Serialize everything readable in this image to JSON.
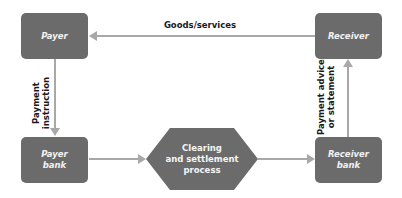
{
  "diagram": {
    "colors": {
      "node_fill": "#6b6b6b",
      "node_text": "#f2f2f2",
      "arrow": "#a8a8a8",
      "edge_text": "#1a1a1a",
      "background": "#ffffff"
    },
    "nodes": {
      "payer": {
        "label": "Payer",
        "shape": "rounded-rect"
      },
      "receiver": {
        "label": "Receiver",
        "shape": "rounded-rect"
      },
      "payer_bank": {
        "label": "Payer\nbank",
        "shape": "rounded-rect"
      },
      "receiver_bank": {
        "label": "Receiver\nbank",
        "shape": "rounded-rect"
      },
      "clearing": {
        "label": "Clearing\nand settlement\nprocess",
        "shape": "hexagon"
      }
    },
    "edges": {
      "goods": {
        "from": "receiver",
        "to": "payer",
        "label": "Goods/services"
      },
      "instruction": {
        "from": "payer",
        "to": "payer_bank",
        "label": "Payment\ninstruction"
      },
      "to_clearing": {
        "from": "payer_bank",
        "to": "clearing",
        "label": ""
      },
      "from_clearing": {
        "from": "clearing",
        "to": "receiver_bank",
        "label": ""
      },
      "advice": {
        "from": "receiver_bank",
        "to": "receiver",
        "label": "Payment advice\nor statement"
      }
    }
  }
}
